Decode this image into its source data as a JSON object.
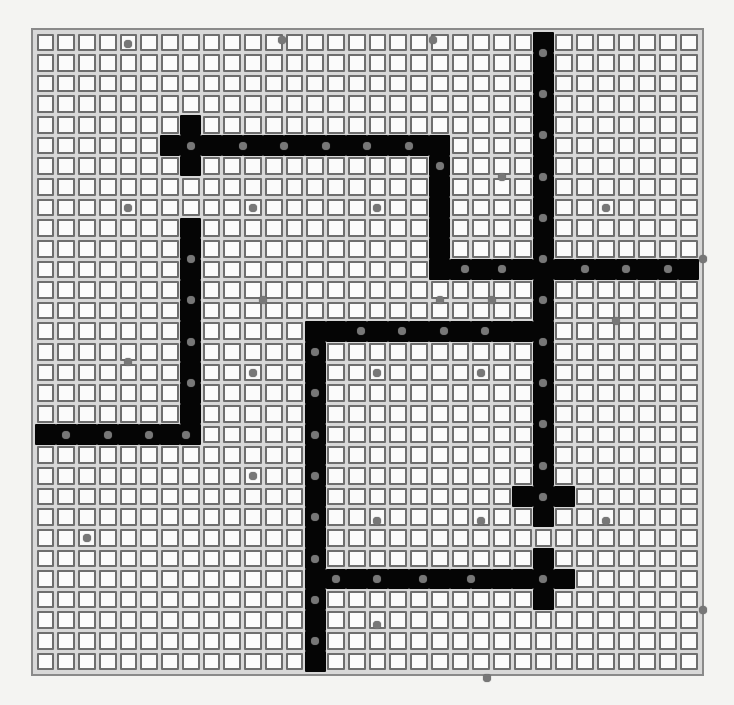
{
  "diagram": {
    "type": "grid-maze",
    "cols": 32,
    "rows": 31,
    "colors": {
      "background": "#f4f4f2",
      "cell_fill": "#fbfbfb",
      "cell_border": "#6e6e6e",
      "filled_cell": "#050505",
      "dot": "#777777"
    },
    "filled_segments": [
      {
        "orientation": "h",
        "row": 5,
        "from": 6,
        "to": 19
      },
      {
        "orientation": "v",
        "col": 7,
        "from": 4,
        "to": 6
      },
      {
        "orientation": "v",
        "col": 19,
        "from": 5,
        "to": 11
      },
      {
        "orientation": "h",
        "row": 11,
        "from": 19,
        "to": 31
      },
      {
        "orientation": "v",
        "col": 24,
        "from": 0,
        "to": 23
      },
      {
        "orientation": "h",
        "row": 22,
        "from": 23,
        "to": 25
      },
      {
        "orientation": "v",
        "col": 7,
        "from": 9,
        "to": 19
      },
      {
        "orientation": "h",
        "row": 19,
        "from": 0,
        "to": 7
      },
      {
        "orientation": "h",
        "row": 14,
        "from": 13,
        "to": 24
      },
      {
        "orientation": "v",
        "col": 13,
        "from": 14,
        "to": 30
      },
      {
        "orientation": "h",
        "row": 26,
        "from": 13,
        "to": 25
      },
      {
        "orientation": "v",
        "col": 24,
        "from": 25,
        "to": 27
      }
    ],
    "dots": [
      [
        0.1,
        4.0
      ],
      [
        -0.1,
        11.4
      ],
      [
        -0.1,
        18.7
      ],
      [
        5,
        7
      ],
      [
        5,
        9.5
      ],
      [
        5,
        11.5
      ],
      [
        5,
        13.5
      ],
      [
        5,
        15.5
      ],
      [
        5,
        17.5
      ],
      [
        0.5,
        24
      ],
      [
        2.5,
        24
      ],
      [
        4.5,
        24
      ],
      [
        6.5,
        24
      ],
      [
        8.5,
        24
      ],
      [
        10.5,
        24
      ],
      [
        12.5,
        24
      ],
      [
        14.5,
        24
      ],
      [
        16.5,
        24
      ],
      [
        18.5,
        24
      ],
      [
        20.5,
        24
      ],
      [
        6,
        19
      ],
      [
        6.5,
        22
      ],
      [
        8,
        4
      ],
      [
        8,
        10
      ],
      [
        8,
        16
      ],
      [
        8,
        27
      ],
      [
        10.5,
        7
      ],
      [
        12.5,
        7
      ],
      [
        14.5,
        7
      ],
      [
        16.5,
        7
      ],
      [
        11,
        20.2
      ],
      [
        11,
        22
      ],
      [
        11,
        26
      ],
      [
        11,
        28
      ],
      [
        11,
        30
      ],
      [
        10.5,
        31.7
      ],
      [
        12.5,
        10.5
      ],
      [
        12.5,
        19
      ],
      [
        12.5,
        21.5
      ],
      [
        13.5,
        27.5
      ],
      [
        14,
        15.2
      ],
      [
        14,
        17.2
      ],
      [
        14,
        19.2
      ],
      [
        14,
        21.2
      ],
      [
        15,
        13
      ],
      [
        17,
        13
      ],
      [
        19,
        13
      ],
      [
        21,
        13
      ],
      [
        23,
        13
      ],
      [
        25,
        13
      ],
      [
        27,
        13
      ],
      [
        29,
        13
      ],
      [
        15.5,
        4
      ],
      [
        16,
        10
      ],
      [
        16,
        16
      ],
      [
        16,
        21
      ],
      [
        19,
        1
      ],
      [
        19,
        3
      ],
      [
        19,
        5
      ],
      [
        19,
        6.8
      ],
      [
        21,
        10
      ],
      [
        22,
        24
      ],
      [
        23.2,
        16
      ],
      [
        23.2,
        21
      ],
      [
        23.2,
        27
      ],
      [
        24,
        2
      ],
      [
        26,
        14
      ],
      [
        26,
        16
      ],
      [
        26,
        18.2
      ],
      [
        26,
        20.5
      ],
      [
        26,
        24
      ],
      [
        28.2,
        16
      ],
      [
        30.8,
        21.3
      ],
      [
        27.5,
        31.7
      ]
    ]
  }
}
